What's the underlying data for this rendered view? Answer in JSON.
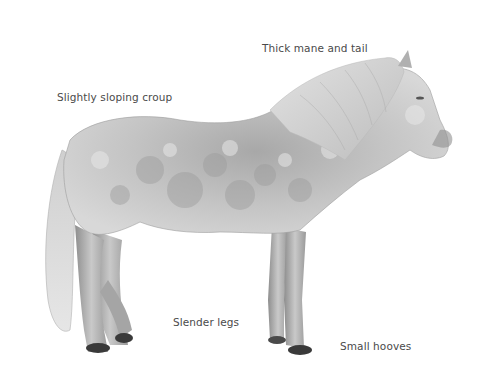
{
  "figure": {
    "annotations": [
      {
        "id": "mane",
        "text": "Thick mane and tail"
      },
      {
        "id": "croup",
        "text": "Slightly sloping croup"
      },
      {
        "id": "legs",
        "text": "Slender legs"
      },
      {
        "id": "hooves",
        "text": "Small hooves"
      }
    ]
  },
  "colors": {
    "background": "#ffffff",
    "label_text": "#4a4a4a",
    "coat_light": "#d9d9d9",
    "coat_mid": "#b5b5b5",
    "coat_dark": "#8a8a8a",
    "hoof": "#3a3a3a"
  }
}
